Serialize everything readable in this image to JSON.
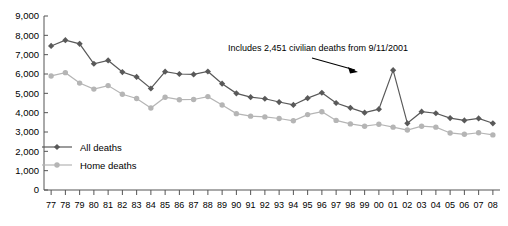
{
  "chart_data": {
    "type": "line",
    "title": "",
    "xlabel": "",
    "ylabel": "",
    "ylim": [
      0,
      9000
    ],
    "ytick_values": [
      0,
      1000,
      2000,
      3000,
      4000,
      5000,
      6000,
      7000,
      8000,
      9000
    ],
    "ytick_labels": [
      "0",
      "1,000",
      "2,000",
      "3,000",
      "4,000",
      "5,000",
      "6,000",
      "7,000",
      "8,000",
      "9,000"
    ],
    "grid": false,
    "legend_position": "inner-lower-left",
    "categories": [
      "77",
      "78",
      "79",
      "80",
      "81",
      "82",
      "83",
      "84",
      "85",
      "86",
      "87",
      "88",
      "89",
      "90",
      "91",
      "92",
      "93",
      "94",
      "95",
      "96",
      "97",
      "98",
      "99",
      "00",
      "01",
      "02",
      "03",
      "04",
      "05",
      "06",
      "07",
      "08"
    ],
    "series": [
      {
        "name": "All deaths",
        "color": "#595959",
        "marker": "diamond",
        "values": [
          7450,
          7750,
          7560,
          6530,
          6700,
          6100,
          5850,
          5250,
          6120,
          6000,
          5980,
          6130,
          5500,
          5000,
          4800,
          4720,
          4550,
          4400,
          4750,
          5030,
          4500,
          4250,
          4000,
          4180,
          6200,
          3450,
          4050,
          3970,
          3720,
          3600,
          3700,
          3450
        ]
      },
      {
        "name": "Home deaths",
        "color": "#b5b5b5",
        "marker": "circle",
        "values": [
          5900,
          6070,
          5530,
          5220,
          5400,
          4950,
          4730,
          4240,
          4800,
          4670,
          4680,
          4830,
          4400,
          3950,
          3820,
          3780,
          3700,
          3580,
          3900,
          4050,
          3600,
          3420,
          3300,
          3400,
          3250,
          3100,
          3300,
          3250,
          2950,
          2880,
          2960,
          2850
        ]
      }
    ],
    "annotations": [
      {
        "text": "Includes 2,451 civilian deaths from 9/11/2001",
        "target_category": "01",
        "target_value": 6200
      }
    ]
  },
  "legend": {
    "entries": [
      {
        "label": "All deaths"
      },
      {
        "label": "Home deaths"
      }
    ]
  }
}
